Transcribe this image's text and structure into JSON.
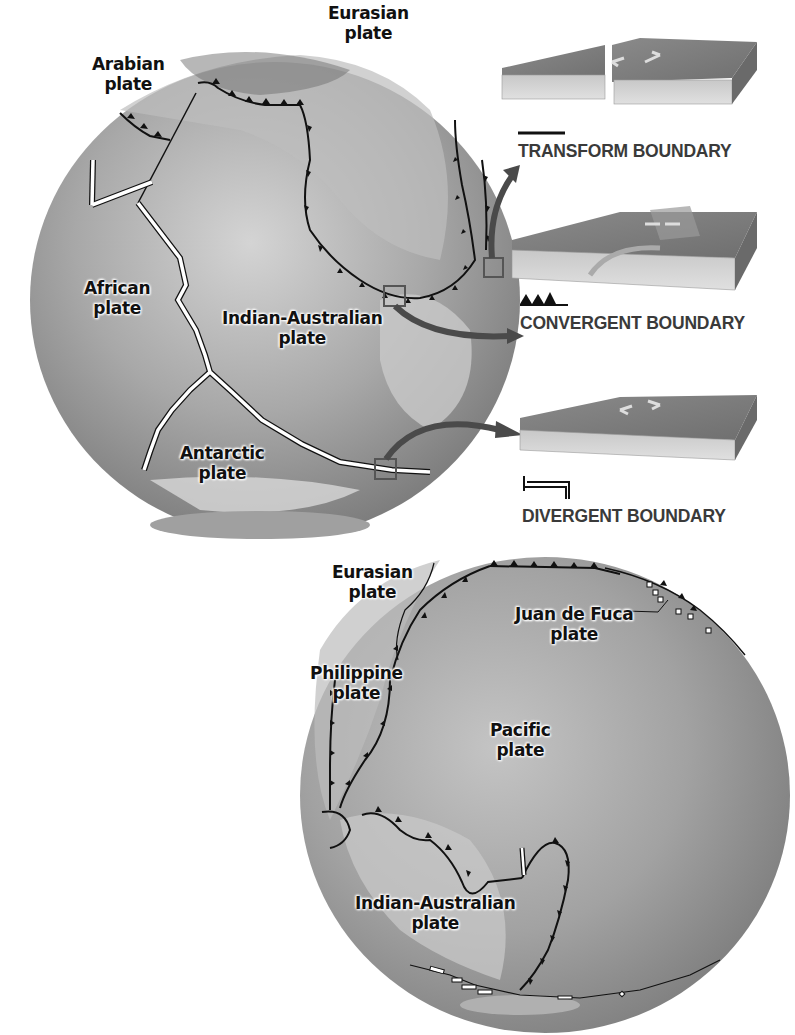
{
  "figure": {
    "top_globe": {
      "labels": [
        {
          "id": "eurasian",
          "line1": "Eurasian",
          "line2": "plate"
        },
        {
          "id": "arabian",
          "line1": "Arabian",
          "line2": "plate"
        },
        {
          "id": "african",
          "line1": "African",
          "line2": "plate"
        },
        {
          "id": "indian_australian",
          "line1": "Indian-Australian",
          "line2": "plate"
        },
        {
          "id": "antarctic",
          "line1": "Antarctic",
          "line2": "plate"
        }
      ]
    },
    "bottom_globe": {
      "labels": [
        {
          "id": "eurasian",
          "line1": "Eurasian",
          "line2": "plate"
        },
        {
          "id": "juan_de_fuca",
          "line1": "Juan de Fuca",
          "line2": "plate"
        },
        {
          "id": "philippine",
          "line1": "Philippine",
          "line2": "plate"
        },
        {
          "id": "pacific",
          "line1": "Pacific",
          "line2": "plate"
        },
        {
          "id": "indian_australian",
          "line1": "Indian-Australian",
          "line2": "plate"
        }
      ]
    },
    "legend": {
      "transform": {
        "title": "TRANSFORM BOUNDARY",
        "symbol": "solid-line"
      },
      "convergent": {
        "title": "CONVERGENT BOUNDARY",
        "symbol": "triangles-on-line"
      },
      "divergent": {
        "title": "DIVERGENT BOUNDARY",
        "symbol": "offset-double-line"
      }
    },
    "colors": {
      "globe_base": "#9a9a9a",
      "globe_light": "#c8c8c8",
      "boundary_line": "#111111",
      "divergent_fill": "#ffffff",
      "callout_arrow": "#4a4a4a",
      "callout_box": "#555555",
      "legend_text": "#3a3a3a"
    }
  }
}
